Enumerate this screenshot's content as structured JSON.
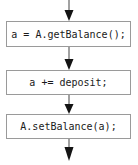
{
  "diagram": {
    "type": "flowchart",
    "orientation": "vertical",
    "title": "",
    "nodes": [
      {
        "id": "node-1",
        "label": "a = A.getBalance();",
        "shape": "rectangle"
      },
      {
        "id": "node-2",
        "label": "a += deposit;",
        "shape": "rectangle"
      },
      {
        "id": "node-3",
        "label": "A.setBalance(a);",
        "shape": "rectangle"
      }
    ],
    "edges": [
      {
        "id": "edge-in",
        "from": "entry",
        "to": "node-1",
        "label": "",
        "style": "solid-arrow"
      },
      {
        "id": "edge-1-2",
        "from": "node-1",
        "to": "node-2",
        "label": "",
        "style": "solid-arrow"
      },
      {
        "id": "edge-2-3",
        "from": "node-2",
        "to": "node-3",
        "label": "",
        "style": "solid-arrow"
      },
      {
        "id": "edge-out",
        "from": "node-3",
        "to": "exit",
        "label": "",
        "style": "solid-arrow"
      }
    ],
    "colors": {
      "node_border": "#9a9a9a",
      "node_fill": "#ffffff",
      "edge": "#8a8a8a",
      "arrowhead": "#1a1a1a",
      "text": "#1a1a1a",
      "background": "#ffffff"
    }
  }
}
